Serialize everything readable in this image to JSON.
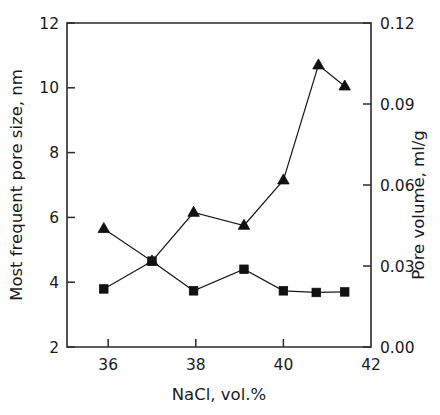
{
  "chart_data": {
    "type": "line",
    "title": "",
    "xlabel": "NaCl, vol.%",
    "ylabel": "Most frequent pore size, nm",
    "y2label": "Pore volume, ml/g",
    "xlim": [
      35.06,
      42.0
    ],
    "ylim": [
      2,
      12
    ],
    "y2lim": [
      0.0,
      0.12
    ],
    "xticks": [
      "36",
      "38",
      "40",
      "42"
    ],
    "xtick_values": [
      36,
      38,
      40,
      42
    ],
    "yticks": [
      "2",
      "4",
      "6",
      "8",
      "10",
      "12"
    ],
    "ytick_values": [
      2,
      4,
      6,
      8,
      10,
      12
    ],
    "y2ticks": [
      "0.00",
      "0.03",
      "0.06",
      "0.09",
      "0.12"
    ],
    "y2tick_values": [
      0.0,
      0.03,
      0.06,
      0.09,
      0.12
    ],
    "grid": false,
    "legend": "none",
    "series": [
      {
        "name": "Most frequent pore size",
        "marker": "triangle",
        "axis": "left",
        "x": [
          35.9,
          37.0,
          37.95,
          39.1,
          40.0,
          40.8,
          41.4
        ],
        "values": [
          5.65,
          4.65,
          6.15,
          5.75,
          7.15,
          10.7,
          10.05
        ]
      },
      {
        "name": "Pore volume",
        "marker": "square",
        "axis": "right",
        "x": [
          35.9,
          37.0,
          37.95,
          39.1,
          40.0,
          40.75,
          41.4
        ],
        "values": [
          0.0215,
          0.0318,
          0.0208,
          0.0288,
          0.0208,
          0.0202,
          0.0204
        ],
        "values_left_scale": [
          3.8,
          4.65,
          3.73,
          4.4,
          3.73,
          3.66,
          3.68
        ]
      }
    ]
  },
  "axes": {
    "left_title": "Most frequent pore size, nm",
    "right_title": "Pore volume, ml/g",
    "bottom_title": "NaCl, vol.%"
  }
}
